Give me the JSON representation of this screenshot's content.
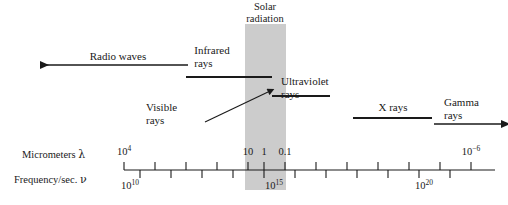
{
  "figure": {
    "type": "electromagnetic-spectrum-diagram",
    "background_color": "#ffffff",
    "line_color": "#1a1a1a",
    "band_color": "#cccccc"
  },
  "solar_band": {
    "label_line1": "Solar",
    "label_line2": "radiation",
    "x_start_px": 245,
    "x_end_px": 286,
    "y_start_px": 24,
    "y_end_px": 190
  },
  "bands": [
    {
      "name": "radio-waves",
      "label": "Radio waves",
      "label_x": 118,
      "label_y": 50,
      "marker": "arrow-left",
      "x1": 38,
      "x2": 188,
      "y": 65
    },
    {
      "name": "infrared-rays",
      "label_line1": "Infrared",
      "label_line2": "rays",
      "label_x": 226,
      "label_y": 44,
      "marker": "segment",
      "x1": 186,
      "x2": 272,
      "y": 77
    },
    {
      "name": "ultraviolet-rays",
      "label_line1": "Ultraviolet",
      "label_line2": "rays",
      "label_x": 277,
      "label_y": 76,
      "marker": "segment",
      "x1": 272,
      "x2": 330,
      "y": 96
    },
    {
      "name": "visible-rays",
      "label_line1": "Visible",
      "label_line2": "rays",
      "label_x": 173,
      "label_y": 103,
      "marker": "leader-arrow",
      "x1": 205,
      "y1": 122,
      "x2": 268,
      "y2": 92
    },
    {
      "name": "x-rays",
      "label": "X rays",
      "label_x": 390,
      "label_y": 103,
      "marker": "segment",
      "x1": 353,
      "x2": 432,
      "y": 118
    },
    {
      "name": "gamma-rays",
      "label_line1": "Gamma",
      "label_line2": "rays",
      "label_x": 469,
      "label_y": 98,
      "marker": "arrow-right",
      "x1": 434,
      "x2": 503,
      "y": 124
    }
  ],
  "axis": {
    "y_px": 170,
    "x_start_px": 124,
    "x_end_px": 495,
    "row1_label": "Micrometers",
    "row1_symbol": "λ",
    "row1_label_x": 20,
    "row1_label_y": 150,
    "row2_label": "Frequency/sec.",
    "row2_symbol": "ν",
    "row2_label_x": 14,
    "row2_label_y": 175,
    "micrometer_ticks": [
      {
        "x": 124,
        "label": "10",
        "exponent": "4",
        "major": true
      },
      {
        "x": 155,
        "label": "",
        "exponent": "",
        "major": true
      },
      {
        "x": 186,
        "label": "",
        "exponent": "",
        "major": true
      },
      {
        "x": 217,
        "label": "",
        "exponent": "",
        "major": true
      },
      {
        "x": 248,
        "label": "10",
        "exponent": "",
        "major": true
      },
      {
        "x": 264,
        "label": "1",
        "exponent": "",
        "major": true
      },
      {
        "x": 285,
        "label": "0.1",
        "exponent": "",
        "major": true
      },
      {
        "x": 316,
        "label": "",
        "exponent": "",
        "major": true
      },
      {
        "x": 347,
        "label": "",
        "exponent": "",
        "major": true
      },
      {
        "x": 378,
        "label": "",
        "exponent": "",
        "major": true
      },
      {
        "x": 409,
        "label": "",
        "exponent": "",
        "major": true
      },
      {
        "x": 440,
        "label": "",
        "exponent": "",
        "major": true
      },
      {
        "x": 471,
        "label": "10",
        "exponent": "−6",
        "major": true
      }
    ],
    "micrometer_tick_labels": [
      {
        "x": 124,
        "base": "10",
        "exp": "4"
      },
      {
        "x": 248,
        "base": "10",
        "exp": ""
      },
      {
        "x": 264,
        "base": "1",
        "exp": ""
      },
      {
        "x": 285,
        "base": "0.1",
        "exp": ""
      },
      {
        "x": 471,
        "base": "10",
        "exp": "−6"
      }
    ],
    "frequency_ticks": [
      {
        "x": 140
      },
      {
        "x": 171
      },
      {
        "x": 202
      },
      {
        "x": 233
      },
      {
        "x": 264
      },
      {
        "x": 295
      },
      {
        "x": 326
      },
      {
        "x": 357
      },
      {
        "x": 388
      },
      {
        "x": 419
      },
      {
        "x": 450
      }
    ],
    "frequency_tick_labels": [
      {
        "x": 130,
        "base": "10",
        "exp": "10"
      },
      {
        "x": 274,
        "base": "10",
        "exp": "15"
      },
      {
        "x": 424,
        "base": "10",
        "exp": "20"
      }
    ]
  }
}
